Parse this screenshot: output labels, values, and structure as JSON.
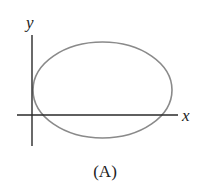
{
  "diagram": {
    "axes": {
      "x_label": "x",
      "y_label": "y",
      "color": "#2a2a2a"
    },
    "curve": {
      "type": "ellipse",
      "color": "#8a8a8a",
      "cx": 102.5,
      "cy": 90,
      "rx": 69.5,
      "ry": 48
    },
    "caption": "(A)"
  }
}
